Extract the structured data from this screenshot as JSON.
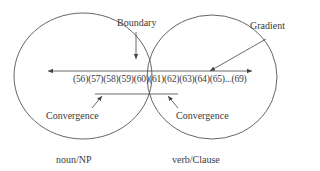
{
  "diagram": {
    "labels": {
      "boundary": "Boundary",
      "gradient": "Gradient",
      "convergence_left": "Convergence",
      "convergence_right": "Convergence",
      "left_category": "noun/NP",
      "right_category": "verb/Clause"
    },
    "scale": {
      "items": [
        "(56)",
        "(57)",
        "(58)",
        "(59)",
        "(60)",
        "(61)",
        "(62)",
        "(63)",
        "(64)",
        "(65)",
        "...",
        "(69)"
      ],
      "text": "(56)(57)(58)(59)(60)(61)(62)(63)(64)(65)...(69)"
    },
    "colors": {
      "stroke": "#444444",
      "text": "#3a3a3a",
      "background": "#ffffff"
    }
  }
}
